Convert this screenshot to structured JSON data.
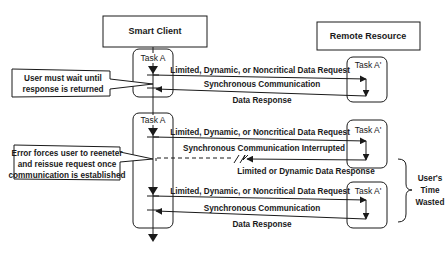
{
  "actors": {
    "client": "Smart Client",
    "remote": "Remote Resource"
  },
  "tasks": {
    "client_task": "Task A",
    "remote_task": "Task A'"
  },
  "sequence_1": {
    "request": "Limited, Dynamic, or Noncritical Data Request",
    "channel": "Synchronous Communication",
    "response": "Data Response"
  },
  "sequence_2": {
    "request": "Limited, Dynamic, or Noncritical Data Request",
    "channel": "Synchronous Communication Interrupted",
    "response": "Limited or Dynamic Data Response"
  },
  "sequence_3": {
    "request": "Limited, Dynamic, or Noncritical Data Request",
    "channel": "Synchronous Communication",
    "response": "Data Response"
  },
  "callouts": {
    "wait_line1": "User must wait until",
    "wait_line2": "response is returned",
    "error_line1": "Error forces user to reeneter",
    "error_line2": "and reissue request once",
    "error_line3": "communication is established"
  },
  "brace_label": {
    "line1": "User's",
    "line2": "Time",
    "line3": "Wasted"
  }
}
